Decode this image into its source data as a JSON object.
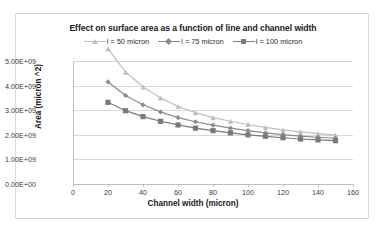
{
  "chart_data": {
    "type": "line",
    "title": "Effect on surface area as a function of line and channel width",
    "xlabel": "Channel width (micron)",
    "ylabel": "Area (micron ^2)",
    "xlim": [
      0,
      160
    ],
    "ylim": [
      0,
      5000000000
    ],
    "grid": true,
    "legend_position": "top-center",
    "x": [
      20,
      30,
      40,
      50,
      60,
      70,
      80,
      90,
      100,
      110,
      120,
      130,
      140,
      150
    ],
    "xticks": [
      "0",
      "20",
      "40",
      "60",
      "80",
      "100",
      "120",
      "140",
      "160"
    ],
    "yticks": [
      "0.00E+00",
      "1.00E+09",
      "2.00E+09",
      "3.00E+09",
      "4.00E+09",
      "5.00E+09"
    ],
    "series": [
      {
        "name": "l = 50 micron",
        "color": "#bfbfbf",
        "marker": "triangle",
        "values": [
          5500000000,
          4550000000,
          3950000000,
          3500000000,
          3150000000,
          2900000000,
          2700000000,
          2550000000,
          2420000000,
          2300000000,
          2200000000,
          2120000000,
          2050000000,
          1990000000
        ]
      },
      {
        "name": "l = 75 micron",
        "color": "#8c8c8c",
        "marker": "diamond",
        "values": [
          4150000000,
          3600000000,
          3220000000,
          2930000000,
          2700000000,
          2530000000,
          2390000000,
          2270000000,
          2170000000,
          2080000000,
          2010000000,
          1950000000,
          1900000000,
          1860000000
        ]
      },
      {
        "name": "l = 100 micron",
        "color": "#7a7a7a",
        "marker": "square",
        "values": [
          3320000000,
          2980000000,
          2740000000,
          2550000000,
          2400000000,
          2270000000,
          2170000000,
          2080000000,
          2000000000,
          1940000000,
          1880000000,
          1830000000,
          1790000000,
          1760000000
        ]
      }
    ]
  },
  "legend": {
    "entries": [
      {
        "label": "l = 50 micron"
      },
      {
        "label": "l = 75 micron"
      },
      {
        "label": "l = 100 micron"
      }
    ]
  },
  "axes": {
    "x_title": "Channel width (micron)",
    "y_title": "Area (micron ^2)"
  },
  "title": "Effect on surface area as a function of line and channel width"
}
